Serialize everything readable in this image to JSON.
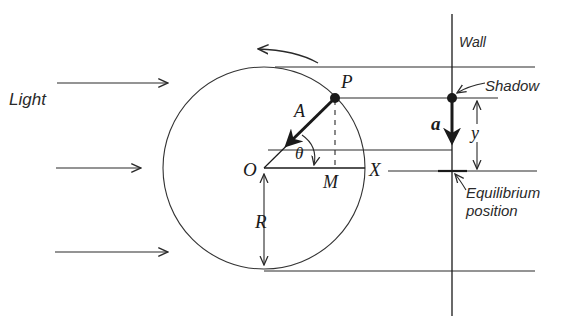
{
  "diagram": {
    "labels": {
      "light": "Light",
      "wall": "Wall",
      "shadow": "Shadow",
      "equilibrium_line1": "Equilibrium",
      "equilibrium_line2": "position",
      "P": "P",
      "A": "A",
      "O": "O",
      "M": "M",
      "X": "X",
      "theta": "θ",
      "R": "R",
      "a": "a",
      "y": "y"
    },
    "colors": {
      "line": "#2a2a2a",
      "background": "#ffffff"
    }
  }
}
